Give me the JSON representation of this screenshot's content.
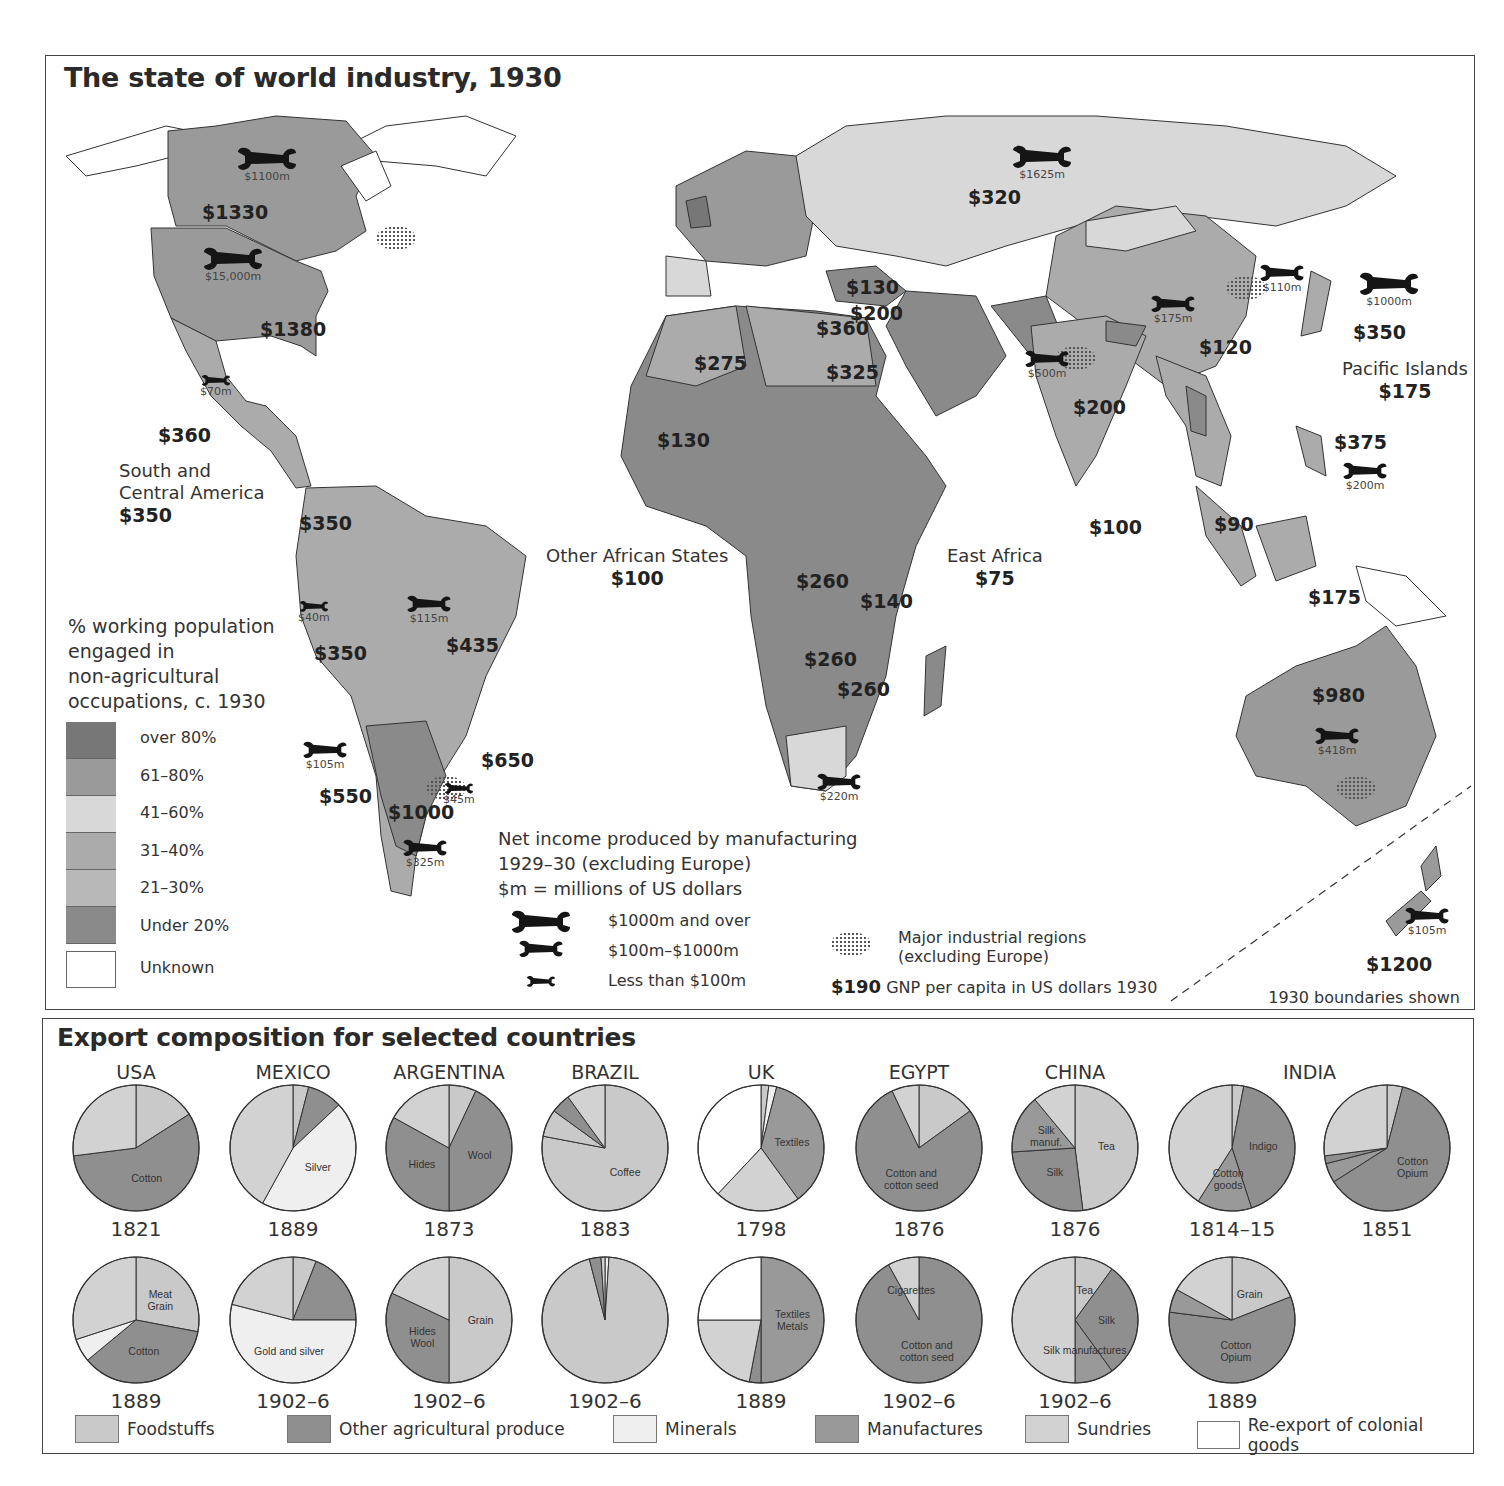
{
  "colors": {
    "over_80": "#777777",
    "61_80": "#9a9a9a",
    "41_60": "#d8d8d8",
    "31_40": "#ababab",
    "21_30": "#b8b8b8",
    "under_20": "#8a8a8a",
    "unknown": "#ffffff",
    "foodstuffs": "#c9c9c9",
    "other_agri": "#8f8f8f",
    "minerals": "#efefef",
    "manufactures": "#999999",
    "sundries": "#d2d2d2",
    "reexport": "#ffffff"
  },
  "map": {
    "title": "The state of world industry, 1930",
    "gnp_labels": [
      {
        "id": "canada",
        "text": "$1330",
        "x": 156,
        "y": 145
      },
      {
        "id": "usa",
        "text": "$1380",
        "x": 214,
        "y": 262
      },
      {
        "id": "mexico",
        "text": "$360",
        "x": 112,
        "y": 368
      },
      {
        "id": "colombia",
        "text": "$350",
        "x": 253,
        "y": 456
      },
      {
        "id": "peru",
        "text": "$350",
        "x": 268,
        "y": 586
      },
      {
        "id": "brazil",
        "text": "$435",
        "x": 400,
        "y": 578
      },
      {
        "id": "uruguay",
        "text": "$650",
        "x": 435,
        "y": 693
      },
      {
        "id": "chile",
        "text": "$550",
        "x": 273,
        "y": 729
      },
      {
        "id": "argentina",
        "text": "$1000",
        "x": 342,
        "y": 745
      },
      {
        "id": "ussr",
        "text": "$320",
        "x": 922,
        "y": 130
      },
      {
        "id": "turkey",
        "text": "$130",
        "x": 800,
        "y": 220
      },
      {
        "id": "syria",
        "text": "$200",
        "x": 804,
        "y": 246
      },
      {
        "id": "libya",
        "text": "$360",
        "x": 770,
        "y": 261
      },
      {
        "id": "algeria",
        "text": "$275",
        "x": 648,
        "y": 296
      },
      {
        "id": "egypt",
        "text": "$325",
        "x": 780,
        "y": 305
      },
      {
        "id": "west_africa",
        "text": "$130",
        "x": 611,
        "y": 373
      },
      {
        "id": "congo",
        "text": "$260",
        "x": 750,
        "y": 514
      },
      {
        "id": "tanganyika",
        "text": "$140",
        "x": 814,
        "y": 534
      },
      {
        "id": "rhodesia_n",
        "text": "$260",
        "x": 758,
        "y": 592
      },
      {
        "id": "rhodesia_s",
        "text": "$260",
        "x": 791,
        "y": 622
      },
      {
        "id": "india",
        "text": "$200",
        "x": 1027,
        "y": 340
      },
      {
        "id": "china",
        "text": "$120",
        "x": 1153,
        "y": 280
      },
      {
        "id": "japan",
        "text": "$350",
        "x": 1307,
        "y": 265
      },
      {
        "id": "ceylon",
        "text": "$100",
        "x": 1043,
        "y": 460
      },
      {
        "id": "malaya",
        "text": "$90",
        "x": 1168,
        "y": 457
      },
      {
        "id": "philippines",
        "text": "$375",
        "x": 1288,
        "y": 375
      },
      {
        "id": "dutch_east_indies",
        "text": "$175",
        "x": 1262,
        "y": 530
      },
      {
        "id": "australia",
        "text": "$980",
        "x": 1266,
        "y": 628
      },
      {
        "id": "new_zealand",
        "text": "$1200",
        "x": 1320,
        "y": 897
      }
    ],
    "region_labels": [
      {
        "id": "south_central_america",
        "lines": [
          "South and",
          "Central America"
        ],
        "value": "$350",
        "x": 73,
        "y": 404
      },
      {
        "id": "other_african_states",
        "lines": [
          "Other African States"
        ],
        "value": "$100",
        "x": 500,
        "y": 489
      },
      {
        "id": "east_africa",
        "lines": [
          "East Africa"
        ],
        "value": "$75",
        "x": 901,
        "y": 489
      },
      {
        "id": "pacific_islands",
        "lines": [
          "Pacific Islands"
        ],
        "value": "$175",
        "x": 1296,
        "y": 302
      }
    ],
    "wrenches": [
      {
        "id": "canada",
        "label": "$1100m",
        "size": "large",
        "x": 190,
        "y": 90
      },
      {
        "id": "usa",
        "label": "$15,000m",
        "size": "large",
        "x": 156,
        "y": 190
      },
      {
        "id": "mexico",
        "label": "$70m",
        "size": "small",
        "x": 154,
        "y": 318
      },
      {
        "id": "peru",
        "label": "$40m",
        "size": "small",
        "x": 252,
        "y": 544
      },
      {
        "id": "brazil",
        "label": "$115m",
        "size": "medium",
        "x": 360,
        "y": 538
      },
      {
        "id": "chile",
        "label": "$105m",
        "size": "medium",
        "x": 256,
        "y": 684
      },
      {
        "id": "uruguay",
        "label": "$45m",
        "size": "small",
        "x": 397,
        "y": 726
      },
      {
        "id": "argentina",
        "label": "$325m",
        "size": "medium",
        "x": 356,
        "y": 782
      },
      {
        "id": "ussr",
        "label": "$1625m",
        "size": "large",
        "x": 965,
        "y": 88
      },
      {
        "id": "manchuria",
        "label": "$110m",
        "size": "medium",
        "x": 1213,
        "y": 207
      },
      {
        "id": "japan",
        "label": "$1000m",
        "size": "large",
        "x": 1312,
        "y": 215
      },
      {
        "id": "china",
        "label": "$175m",
        "size": "medium",
        "x": 1104,
        "y": 238
      },
      {
        "id": "india",
        "label": "$500m",
        "size": "medium",
        "x": 978,
        "y": 293
      },
      {
        "id": "philippines",
        "label": "$200m",
        "size": "medium",
        "x": 1296,
        "y": 405
      },
      {
        "id": "south_africa",
        "label": "$220m",
        "size": "medium",
        "x": 770,
        "y": 716
      },
      {
        "id": "australia",
        "label": "$418m",
        "size": "medium",
        "x": 1268,
        "y": 670
      },
      {
        "id": "new_zealand",
        "label": "$105m",
        "size": "medium",
        "x": 1358,
        "y": 850
      }
    ],
    "choropleth_legend": {
      "title_lines": [
        "% working population",
        "engaged in",
        "non-agricultural",
        "occupations, c. 1930"
      ],
      "items": [
        {
          "label": "over 80%",
          "color_key": "over_80"
        },
        {
          "label": "61–80%",
          "color_key": "61_80"
        },
        {
          "label": "41–60%",
          "color_key": "41_60"
        },
        {
          "label": "31–40%",
          "color_key": "31_40"
        },
        {
          "label": "21–30%",
          "color_key": "21_30"
        },
        {
          "label": "Under 20%",
          "color_key": "under_20"
        },
        {
          "label": "Unknown",
          "color_key": "unknown"
        }
      ]
    },
    "manufacturing_legend": {
      "title_lines": [
        "Net income produced by manufacturing",
        "1929–30 (excluding Europe)",
        "$m = millions of US dollars"
      ],
      "items": [
        {
          "label": "$1000m and over",
          "size": "large"
        },
        {
          "label": "$100m–$1000m",
          "size": "medium"
        },
        {
          "label": "Less than $100m",
          "size": "small"
        }
      ]
    },
    "industrial_regions_label": [
      "Major industrial regions",
      "(excluding Europe)"
    ],
    "gnp_legend": {
      "sample": "$190",
      "text": "GNP per capita in US dollars 1930"
    },
    "boundaries_note": "1930 boundaries shown"
  },
  "exports": {
    "title": "Export composition for selected countries",
    "countries": [
      "USA",
      "MEXICO",
      "ARGENTINA",
      "BRAZIL",
      "UK",
      "EGYPT",
      "CHINA",
      "INDIA"
    ],
    "legend": [
      {
        "label": "Foodstuffs",
        "color_key": "foodstuffs"
      },
      {
        "label": "Other agricultural produce",
        "color_key": "other_agri"
      },
      {
        "label": "Minerals",
        "color_key": "minerals"
      },
      {
        "label": "Manufactures",
        "color_key": "manufactures"
      },
      {
        "label": "Sundries",
        "color_key": "sundries"
      },
      {
        "label": "Re-export of colonial goods",
        "color_key": "reexport"
      }
    ]
  },
  "chart_data": {
    "type": "pie",
    "title": "Export composition for selected countries",
    "categories": [
      "Foodstuffs",
      "Other agricultural produce",
      "Minerals",
      "Manufactures",
      "Sundries",
      "Re-export of colonial goods"
    ],
    "pies": [
      {
        "country": "USA",
        "year": "1821",
        "row": 0,
        "col": 0,
        "slices": [
          {
            "cat": "Foodstuffs",
            "value": 16
          },
          {
            "cat": "Other agricultural produce",
            "value": 57,
            "labels": [
              "Cotton"
            ]
          },
          {
            "cat": "Sundries",
            "value": 27
          }
        ]
      },
      {
        "country": "MEXICO",
        "year": "1889",
        "row": 0,
        "col": 1,
        "slices": [
          {
            "cat": "Foodstuffs",
            "value": 4
          },
          {
            "cat": "Other agricultural produce",
            "value": 9
          },
          {
            "cat": "Minerals",
            "value": 45,
            "labels": [
              "Silver"
            ]
          },
          {
            "cat": "Sundries",
            "value": 42
          }
        ]
      },
      {
        "country": "ARGENTINA",
        "year": "1873",
        "row": 0,
        "col": 2,
        "slices": [
          {
            "cat": "Foodstuffs",
            "value": 7
          },
          {
            "cat": "Other agricultural produce",
            "value": 43,
            "labels": [
              "Wool"
            ]
          },
          {
            "cat": "Other agricultural produce",
            "value": 33,
            "labels": [
              "Hides"
            ]
          },
          {
            "cat": "Sundries",
            "value": 17
          }
        ]
      },
      {
        "country": "BRAZIL",
        "year": "1883",
        "row": 0,
        "col": 3,
        "slices": [
          {
            "cat": "Foodstuffs",
            "value": 78,
            "labels": [
              "Coffee"
            ]
          },
          {
            "cat": "Foodstuffs",
            "value": 7
          },
          {
            "cat": "Other agricultural produce",
            "value": 5
          },
          {
            "cat": "Sundries",
            "value": 10
          }
        ]
      },
      {
        "country": "UK",
        "year": "1798",
        "row": 0,
        "col": 4,
        "slices": [
          {
            "cat": "Foodstuffs",
            "value": 2
          },
          {
            "cat": "Minerals",
            "value": 2
          },
          {
            "cat": "Manufactures",
            "value": 36,
            "labels": [
              "Textiles"
            ]
          },
          {
            "cat": "Sundries",
            "value": 22
          },
          {
            "cat": "Re-export of colonial goods",
            "value": 38
          }
        ]
      },
      {
        "country": "EGYPT",
        "year": "1876",
        "row": 0,
        "col": 5,
        "slices": [
          {
            "cat": "Foodstuffs",
            "value": 15
          },
          {
            "cat": "Other agricultural produce",
            "value": 78,
            "labels": [
              "Cotton and",
              "cotton seed"
            ]
          },
          {
            "cat": "Sundries",
            "value": 7
          }
        ]
      },
      {
        "country": "CHINA",
        "year": "1876",
        "row": 0,
        "col": 6,
        "slices": [
          {
            "cat": "Foodstuffs",
            "value": 48,
            "labels": [
              "Tea"
            ]
          },
          {
            "cat": "Other agricultural produce",
            "value": 26,
            "labels": [
              "Silk"
            ]
          },
          {
            "cat": "Manufactures",
            "value": 15,
            "labels": [
              "Silk",
              "manuf."
            ]
          },
          {
            "cat": "Sundries",
            "value": 11
          }
        ]
      },
      {
        "country": "INDIA",
        "year": "1814–15",
        "row": 0,
        "col": 7,
        "slices": [
          {
            "cat": "Foodstuffs",
            "value": 3
          },
          {
            "cat": "Other agricultural produce",
            "value": 42,
            "labels": [
              "Indigo"
            ]
          },
          {
            "cat": "Manufactures",
            "value": 14,
            "labels": [
              "Cotton",
              "goods"
            ]
          },
          {
            "cat": "Sundries",
            "value": 41
          }
        ]
      },
      {
        "country": "INDIA",
        "year": "1851",
        "row": 0,
        "col": 8,
        "slices": [
          {
            "cat": "Foodstuffs",
            "value": 4
          },
          {
            "cat": "Other agricultural produce",
            "value": 62,
            "labels": [
              "Cotton",
              "Opium"
            ]
          },
          {
            "cat": "Manufactures",
            "value": 5
          },
          {
            "cat": "Other agricultural produce",
            "value": 2
          },
          {
            "cat": "Sundries",
            "value": 27
          }
        ]
      },
      {
        "country": "USA",
        "year": "1889",
        "row": 1,
        "col": 0,
        "slices": [
          {
            "cat": "Foodstuffs",
            "value": 28,
            "labels": [
              "Meat",
              "Grain"
            ]
          },
          {
            "cat": "Other agricultural produce",
            "value": 36,
            "labels": [
              "Cotton"
            ]
          },
          {
            "cat": "Minerals",
            "value": 6
          },
          {
            "cat": "Sundries",
            "value": 30
          }
        ]
      },
      {
        "country": "MEXICO",
        "year": "1902–6",
        "row": 1,
        "col": 1,
        "slices": [
          {
            "cat": "Foodstuffs",
            "value": 6
          },
          {
            "cat": "Other agricultural produce",
            "value": 19
          },
          {
            "cat": "Minerals",
            "value": 54,
            "labels": [
              "Gold and silver"
            ]
          },
          {
            "cat": "Sundries",
            "value": 21
          }
        ]
      },
      {
        "country": "ARGENTINA",
        "year": "1902–6",
        "row": 1,
        "col": 2,
        "slices": [
          {
            "cat": "Foodstuffs",
            "value": 50,
            "labels": [
              "Grain"
            ]
          },
          {
            "cat": "Other agricultural produce",
            "value": 32,
            "labels": [
              "Hides",
              "Wool"
            ]
          },
          {
            "cat": "Sundries",
            "value": 18
          }
        ]
      },
      {
        "country": "BRAZIL",
        "year": "1902–6",
        "row": 1,
        "col": 3,
        "slices": [
          {
            "cat": "Minerals",
            "value": 1
          },
          {
            "cat": "Foodstuffs",
            "value": 95
          },
          {
            "cat": "Other agricultural produce",
            "value": 3
          },
          {
            "cat": "Sundries",
            "value": 1
          }
        ]
      },
      {
        "country": "UK",
        "year": "1889",
        "row": 1,
        "col": 4,
        "slices": [
          {
            "cat": "Manufactures",
            "value": 50,
            "labels": [
              "Textiles",
              "Metals"
            ]
          },
          {
            "cat": "Other agricultural produce",
            "value": 3
          },
          {
            "cat": "Sundries",
            "value": 22
          },
          {
            "cat": "Re-export of colonial goods",
            "value": 25
          }
        ]
      },
      {
        "country": "EGYPT",
        "year": "1902–6",
        "row": 1,
        "col": 5,
        "slices": [
          {
            "cat": "Other agricultural produce",
            "value": 92,
            "labels": [
              "Cotton and",
              "cotton seed"
            ]
          },
          {
            "cat": "Sundries",
            "value": 8,
            "labels": [
              "Cigarettes"
            ]
          }
        ]
      },
      {
        "country": "CHINA",
        "year": "1902–6",
        "row": 1,
        "col": 6,
        "slices": [
          {
            "cat": "Foodstuffs",
            "value": 10,
            "labels": [
              "Tea"
            ]
          },
          {
            "cat": "Other agricultural produce",
            "value": 30,
            "labels": [
              "Silk"
            ]
          },
          {
            "cat": "Manufactures",
            "value": 10,
            "labels": [
              "Silk manufactures"
            ]
          },
          {
            "cat": "Sundries",
            "value": 50
          }
        ]
      },
      {
        "country": "INDIA",
        "year": "1889",
        "row": 1,
        "col": 7,
        "slices": [
          {
            "cat": "Foodstuffs",
            "value": 19,
            "labels": [
              "Grain"
            ]
          },
          {
            "cat": "Other agricultural produce",
            "value": 58,
            "labels": [
              "Cotton",
              "Opium"
            ]
          },
          {
            "cat": "Manufactures",
            "value": 6
          },
          {
            "cat": "Sundries",
            "value": 17
          }
        ]
      }
    ]
  }
}
